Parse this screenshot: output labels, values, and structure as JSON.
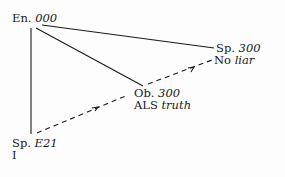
{
  "nodes": {
    "en": {
      "prefix": "En.",
      "code": "000"
    },
    "sp_top": {
      "prefix": "Sp.",
      "code": "300",
      "sub_plain": "No",
      "sub_italic": "liar"
    },
    "ob": {
      "prefix": "Ob.",
      "code": "300",
      "sub_plain": "ALS",
      "sub_italic": "truth"
    },
    "sp_bottom": {
      "prefix": "Sp.",
      "code": "E21",
      "sub_plain": "I"
    }
  },
  "edges": [
    {
      "from": "en",
      "to": "sp_top",
      "style": "solid"
    },
    {
      "from": "en",
      "to": "ob",
      "style": "solid"
    },
    {
      "from": "en",
      "to": "sp_bottom",
      "style": "solid"
    },
    {
      "from": "sp_bottom",
      "to": "ob",
      "style": "dashed-arrow"
    },
    {
      "from": "ob",
      "to": "sp_top",
      "style": "dashed-arrow"
    }
  ],
  "colors": {
    "ink": "#1a1a1a",
    "paper": "#fdfdfd"
  }
}
